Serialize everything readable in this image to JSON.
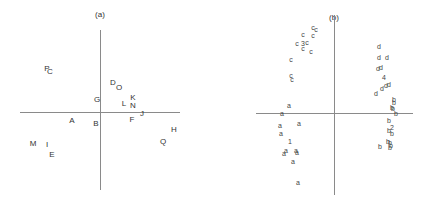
{
  "chart_data": [
    {
      "type": "scatter",
      "title": "(a)",
      "xlabel": "",
      "ylabel": "",
      "grid": false,
      "legend": null,
      "axes_origin_px": [
        100,
        112
      ],
      "points": [
        {
          "label": "P",
          "x": -53,
          "y": 43
        },
        {
          "label": "C",
          "x": -50,
          "y": 40
        },
        {
          "label": "D",
          "x": 13,
          "y": 29
        },
        {
          "label": "O",
          "x": 19,
          "y": 24
        },
        {
          "label": "G",
          "x": -3,
          "y": 12
        },
        {
          "label": "L",
          "x": 24,
          "y": 8
        },
        {
          "label": "K",
          "x": 33,
          "y": 14
        },
        {
          "label": "N",
          "x": 33,
          "y": 6
        },
        {
          "label": "J",
          "x": 42,
          "y": -2
        },
        {
          "label": "A",
          "x": -28,
          "y": -9
        },
        {
          "label": "B",
          "x": -4,
          "y": -12
        },
        {
          "label": "F",
          "x": 32,
          "y": -8
        },
        {
          "label": "H",
          "x": 74,
          "y": -18
        },
        {
          "label": "Q",
          "x": 63,
          "y": -30
        },
        {
          "label": "M",
          "x": -67,
          "y": -32
        },
        {
          "label": "I",
          "x": -53,
          "y": -33
        },
        {
          "label": "E",
          "x": -48,
          "y": -43
        }
      ]
    },
    {
      "type": "scatter",
      "title": "(b)",
      "xlabel": "",
      "ylabel": "",
      "grid": false,
      "legend": null,
      "axes_origin_px": [
        334,
        113
      ],
      "series": [
        {
          "name": "c",
          "points": [
            {
              "label": "c",
              "x": -21,
              "y": 85
            },
            {
              "label": "c",
              "x": -18,
              "y": 83
            },
            {
              "label": "c",
              "x": -31,
              "y": 78
            },
            {
              "label": "c",
              "x": -21,
              "y": 77
            },
            {
              "label": "c",
              "x": -37,
              "y": 69
            },
            {
              "label": "3",
              "x": -31,
              "y": 69
            },
            {
              "label": "c",
              "x": -27,
              "y": 70
            },
            {
              "label": "c",
              "x": -31,
              "y": 64
            },
            {
              "label": "c",
              "x": -23,
              "y": 61
            },
            {
              "label": "c",
              "x": -43,
              "y": 53
            },
            {
              "label": "c",
              "x": -43,
              "y": 37
            },
            {
              "label": "c",
              "x": -42,
              "y": 33
            }
          ]
        },
        {
          "name": "d",
          "points": [
            {
              "label": "d",
              "x": 45,
              "y": 66
            },
            {
              "label": "d",
              "x": 45,
              "y": 55
            },
            {
              "label": "d",
              "x": 53,
              "y": 55
            },
            {
              "label": "d",
              "x": 44,
              "y": 44
            },
            {
              "label": "d",
              "x": 47,
              "y": 45
            },
            {
              "label": "4",
              "x": 50,
              "y": 35
            },
            {
              "label": "d",
              "x": 52,
              "y": 27
            },
            {
              "label": "d",
              "x": 55,
              "y": 28
            },
            {
              "label": "d",
              "x": 48,
              "y": 24
            },
            {
              "label": "d",
              "x": 42,
              "y": 19
            }
          ]
        },
        {
          "name": "a",
          "points": [
            {
              "label": "a",
              "x": -45,
              "y": 7
            },
            {
              "label": "a",
              "x": -52,
              "y": -1
            },
            {
              "label": "a",
              "x": -35,
              "y": -11
            },
            {
              "label": "a",
              "x": -54,
              "y": -13
            },
            {
              "label": "a",
              "x": -53,
              "y": -21
            },
            {
              "label": "1",
              "x": -44,
              "y": -29
            },
            {
              "label": "a",
              "x": -48,
              "y": -38
            },
            {
              "label": "a",
              "x": -50,
              "y": -41
            },
            {
              "label": "a",
              "x": -38,
              "y": -38
            },
            {
              "label": "a",
              "x": -37,
              "y": -40
            },
            {
              "label": "a",
              "x": -41,
              "y": -49
            },
            {
              "label": "a",
              "x": -36,
              "y": -70
            }
          ]
        },
        {
          "name": "b",
          "points": [
            {
              "label": "b",
              "x": 60,
              "y": 13
            },
            {
              "label": "b",
              "x": 60,
              "y": 10
            },
            {
              "label": "b",
              "x": 58,
              "y": 5
            },
            {
              "label": "b",
              "x": 59,
              "y": 4
            },
            {
              "label": "b",
              "x": 62,
              "y": -1
            },
            {
              "label": "b",
              "x": 55,
              "y": -8
            },
            {
              "label": "2",
              "x": 58,
              "y": -15
            },
            {
              "label": "b",
              "x": 55,
              "y": -18
            },
            {
              "label": "b",
              "x": 58,
              "y": -21
            },
            {
              "label": "b",
              "x": 54,
              "y": -29
            },
            {
              "label": "b",
              "x": 56,
              "y": -30
            },
            {
              "label": "b",
              "x": 57,
              "y": -33
            },
            {
              "label": "b",
              "x": 46,
              "y": -34
            },
            {
              "label": "b",
              "x": 56,
              "y": -35
            }
          ]
        }
      ]
    }
  ],
  "panels": {
    "a": {
      "title": "(a)"
    },
    "b": {
      "title": "(b)"
    }
  }
}
